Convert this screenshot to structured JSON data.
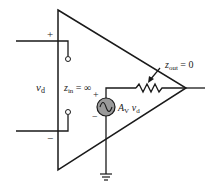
{
  "diagram": {
    "type": "op-amp equivalent circuit",
    "labels": {
      "input_plus": "+",
      "input_minus": "−",
      "vd": "v",
      "vd_sub": "d",
      "zin": "z",
      "zin_sub": "in",
      "zin_value": " = ∞",
      "source_plus": "+",
      "source_minus": "−",
      "gain": "A",
      "gain_sub": "V",
      "gain_v": " v",
      "gain_v_sub": "d",
      "zout": "z",
      "zout_sub": "out",
      "zout_value": " = 0"
    },
    "colors": {
      "line": "#1a1a1a",
      "source_fill": "#9a9a9a",
      "background": "#ffffff"
    }
  }
}
